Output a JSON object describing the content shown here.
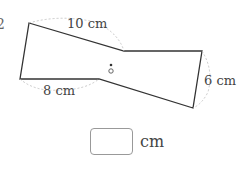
{
  "problem": {
    "number_fragment": "2",
    "figure_type": "point-symmetric hexagon",
    "labels": {
      "top": "10 cm",
      "bottom_left": "8 cm",
      "right": "6 cm"
    },
    "center_point_label": "o",
    "answer": {
      "value": "",
      "unit": "cm"
    }
  }
}
